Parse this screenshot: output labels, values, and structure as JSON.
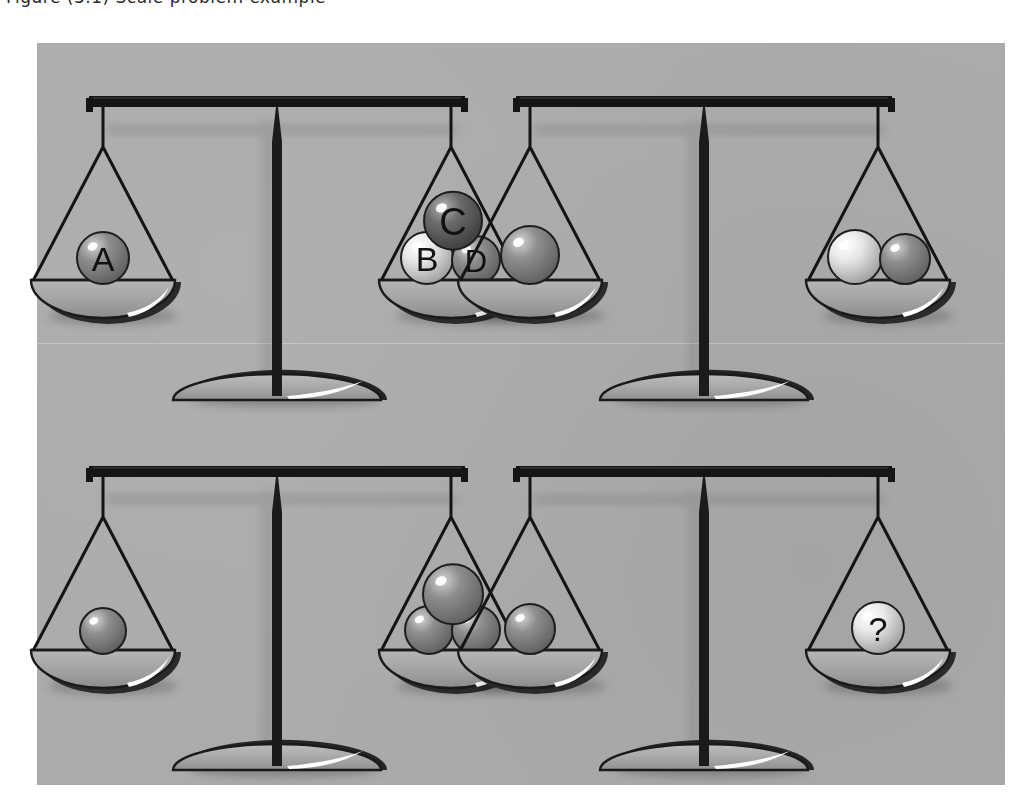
{
  "header": {
    "cropped_text": "Figure (3.1)   Scale problem example"
  },
  "page": {
    "background_color": "#ffffff",
    "panel_color": "#ababab",
    "panel": {
      "x": 37,
      "y": 43,
      "width": 968,
      "height": 742
    }
  },
  "palette": {
    "ink": "#1a1a1a",
    "pan_metal_light": "#c9c9c9",
    "pan_metal_mid": "#9a9a9a",
    "pan_highlight": "#ffffff",
    "ball_mid": "#8e8e8e",
    "ball_dark": "#6b6b6b",
    "ball_light": "#e8e8e8",
    "shadow": "rgba(0,0,0,0.18)"
  },
  "scales": [
    {
      "id": "scale-1",
      "name": "scale-top-left",
      "state": "balanced",
      "left_pan": {
        "name": "left-pan",
        "balls": [
          {
            "label": "A",
            "tone": "mid",
            "radius": 26
          }
        ]
      },
      "right_pan": {
        "name": "right-pan",
        "balls": [
          {
            "label": "C",
            "tone": "dark",
            "radius": 29
          },
          {
            "label": "B",
            "tone": "light",
            "radius": 26
          },
          {
            "label": "D",
            "tone": "mid",
            "radius": 24
          }
        ]
      }
    },
    {
      "id": "scale-2",
      "name": "scale-top-right",
      "state": "balanced",
      "left_pan": {
        "name": "left-pan",
        "balls": [
          {
            "label": "",
            "tone": "mid",
            "radius": 29
          }
        ]
      },
      "right_pan": {
        "name": "right-pan",
        "balls": [
          {
            "label": "",
            "tone": "light",
            "radius": 27
          },
          {
            "label": "",
            "tone": "mid",
            "radius": 25
          }
        ]
      }
    },
    {
      "id": "scale-3",
      "name": "scale-bottom-left",
      "state": "balanced",
      "left_pan": {
        "name": "left-pan",
        "balls": [
          {
            "label": "",
            "tone": "mid",
            "radius": 23
          }
        ]
      },
      "right_pan": {
        "name": "right-pan",
        "balls": [
          {
            "label": "",
            "tone": "mid",
            "radius": 30
          },
          {
            "label": "",
            "tone": "mid",
            "radius": 24
          },
          {
            "label": "",
            "tone": "mid",
            "radius": 24
          }
        ]
      }
    },
    {
      "id": "scale-4",
      "name": "scale-bottom-right",
      "state": "balanced",
      "left_pan": {
        "name": "left-pan",
        "balls": [
          {
            "label": "",
            "tone": "mid",
            "radius": 25
          }
        ]
      },
      "right_pan": {
        "name": "right-pan",
        "balls": [
          {
            "label": "?",
            "tone": "light",
            "radius": 26
          }
        ]
      }
    }
  ]
}
